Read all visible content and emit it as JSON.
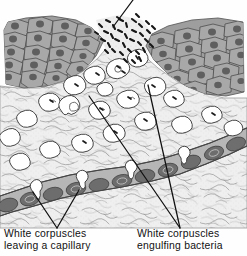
{
  "figure": {
    "kind": "scientific-illustration",
    "style": "vintage halftone line drawing, grayscale",
    "background_color": "#fefefe",
    "ink_color": "#111111",
    "width": 247,
    "height": 256
  },
  "labels": {
    "left": {
      "line1": "White corpuscles",
      "line2": "leaving a capillary"
    },
    "right": {
      "line1": "White corpuscles",
      "line2": "engulfing bacteria"
    }
  },
  "leaders": [
    {
      "name": "bacteria-cluster-leader",
      "from": [
        133,
        0
      ],
      "to": [
        113,
        27
      ]
    },
    {
      "name": "left-leader-a",
      "from": [
        57,
        228
      ],
      "to": [
        33,
        192
      ]
    },
    {
      "name": "left-leader-b",
      "from": [
        57,
        228
      ],
      "to": [
        79,
        190
      ]
    },
    {
      "name": "right-leader-a",
      "from": [
        180,
        228
      ],
      "to": [
        89,
        96
      ]
    },
    {
      "name": "right-leader-b",
      "from": [
        180,
        228
      ],
      "to": [
        148,
        85
      ]
    }
  ],
  "regions": {
    "epithelium_left": {
      "name": "epithelial-tissue-left",
      "fill": "#9a9a9a"
    },
    "epithelium_right": {
      "name": "epithelial-tissue-right",
      "fill": "#9a9a9a"
    },
    "wound_gap": {
      "name": "wound-opening",
      "fill": "#ececec"
    },
    "connective_tissue": {
      "name": "connective-tissue",
      "fill": "#eeeeee"
    },
    "capillary": {
      "name": "capillary-vessel",
      "fill": "#b4b4b4"
    },
    "red_cells": {
      "name": "red-blood-cell",
      "fill": "#6f6f6f"
    },
    "white_cells": {
      "name": "white-corpuscle",
      "fill": "#ffffff"
    },
    "bacteria": {
      "name": "bacterium",
      "fill": "#1a1a1a"
    }
  },
  "counts": {
    "white_corpuscles": 26,
    "red_blood_cells": 14,
    "bacteria": 70
  }
}
